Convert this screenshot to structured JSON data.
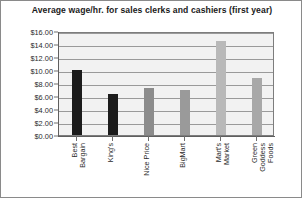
{
  "chart_data": {
    "type": "bar",
    "title": "Average wage/hr. for sales clerks and cashiers (first year)",
    "xlabel": "",
    "ylabel": "",
    "ylim": [
      0,
      16
    ],
    "ytick_step": 2,
    "grid": true,
    "legend": "none",
    "categories": [
      "Best Bargain",
      "King's",
      "Nice Price",
      "BigMart",
      "Mart's Market",
      "Green Goddess Foods"
    ],
    "category_lines": [
      [
        "Best",
        "Bargain"
      ],
      [
        "King's"
      ],
      [
        "Nice Price"
      ],
      [
        "BigMart"
      ],
      [
        "Mart's",
        "Market"
      ],
      [
        "Green",
        "Goddess",
        "Foods"
      ]
    ],
    "values": [
      10.0,
      6.25,
      7.25,
      7.0,
      14.5,
      8.75
    ],
    "ytick_labels": [
      "$16.00",
      "$14.00",
      "$12.00",
      "$10.00",
      "$8.00",
      "$6.00",
      "$4.00",
      "$2.00",
      "$0.00"
    ],
    "ytick_values": [
      16,
      14,
      12,
      10,
      8,
      6,
      4,
      2,
      0
    ],
    "bar_colors": [
      "#1c1c1c",
      "#1c1c1c",
      "#8c8c8c",
      "#9a9a9a",
      "#b9b9b9",
      "#a8a8a8"
    ],
    "plot_background": "#f2f2f2",
    "grid_color": "#9a9a9a",
    "border_color": "#8a8a8a"
  }
}
